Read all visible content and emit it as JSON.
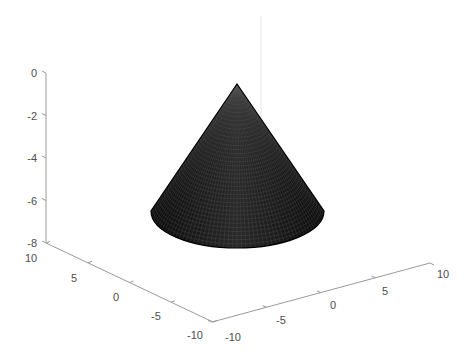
{
  "chart_data": {
    "type": "surface3d",
    "title": "",
    "xlabel": "",
    "ylabel": "",
    "zlabel": "",
    "surface": {
      "shape": "cone",
      "apex": [
        0,
        0,
        0
      ],
      "base_center": [
        0,
        0,
        -6
      ],
      "base_radius": 7,
      "color": "#111111",
      "edge_color": "#4a4a4a"
    },
    "xlim": [
      -10,
      10
    ],
    "ylim": [
      -10,
      10
    ],
    "zlim": [
      -8,
      0
    ],
    "grid": false,
    "axes": {
      "z": {
        "ticks": [
          0,
          -2,
          -4,
          -6,
          -8
        ],
        "tick_labels": [
          "0",
          "-2",
          "-4",
          "-6",
          "-8"
        ]
      },
      "y_left": {
        "ticks": [
          10,
          5,
          0,
          -5,
          -10
        ],
        "tick_labels": [
          "10",
          "5",
          "0",
          "-5",
          "-10"
        ]
      },
      "x_right": {
        "ticks": [
          -10,
          -5,
          0,
          5,
          10
        ],
        "tick_labels": [
          "-10",
          "-5",
          "0",
          "5",
          "10"
        ]
      }
    },
    "legend": null
  },
  "colors": {
    "axis": "#9a9a9a",
    "tick_text": "#4d4d4d",
    "surface": "#111111",
    "background": "#ffffff"
  }
}
